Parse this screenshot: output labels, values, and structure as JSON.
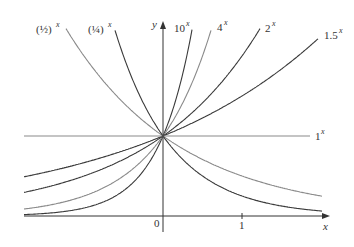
{
  "chart_data": {
    "type": "line",
    "title": "",
    "xlabel": "x",
    "ylabel": "y",
    "x_ticks": [
      {
        "value": 0,
        "label": "0"
      },
      {
        "value": 1,
        "label": "1"
      }
    ],
    "xlim": [
      -1.76,
      2.0
    ],
    "ylim": [
      0,
      2.4
    ],
    "grid": false,
    "legend": "inline labels at curve ends",
    "series": [
      {
        "name": "(1/2)^x",
        "base": 0.5,
        "label_main": "(½)",
        "label_sup": "x",
        "color": "#8a8a8a"
      },
      {
        "name": "(1/4)^x",
        "base": 0.25,
        "label_main": "(¼)",
        "label_sup": "x",
        "color": "#3a3a3a"
      },
      {
        "name": "10^x",
        "base": 10,
        "label_main": "10",
        "label_sup": "x",
        "color": "#3a3a3a"
      },
      {
        "name": "4^x",
        "base": 4,
        "label_main": "4",
        "label_sup": "x",
        "color": "#8a8a8a"
      },
      {
        "name": "2^x",
        "base": 2,
        "label_main": "2",
        "label_sup": "x",
        "color": "#3a3a3a"
      },
      {
        "name": "1.5^x",
        "base": 1.5,
        "label_main": "1.5",
        "label_sup": "x",
        "color": "#3a3a3a"
      },
      {
        "name": "1^x",
        "base": 1,
        "label_main": "1",
        "label_sup": "x",
        "color": "#8a8a8a"
      }
    ]
  },
  "labels": {
    "x_axis": "x",
    "y_axis": "y",
    "tick_0": "0",
    "tick_1": "1",
    "half": {
      "main": "(½)",
      "sup": "x"
    },
    "quarter": {
      "main": "(¼)",
      "sup": "x"
    },
    "ten": {
      "main": "10",
      "sup": "x"
    },
    "four": {
      "main": "4",
      "sup": "x"
    },
    "two": {
      "main": "2",
      "sup": "x"
    },
    "onefive": {
      "main": "1.5",
      "sup": "x"
    },
    "one": {
      "main": "1",
      "sup": "x"
    }
  }
}
